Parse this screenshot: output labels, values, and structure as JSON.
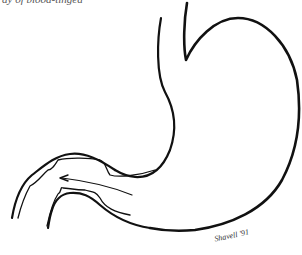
{
  "figure": {
    "caption_fragment": "ay of blood-tinged",
    "signature": "Shavell '91",
    "colors": {
      "line": "#111111",
      "background": "#ffffff"
    }
  }
}
